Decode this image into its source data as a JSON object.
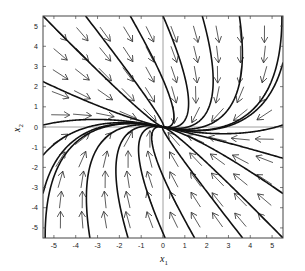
{
  "chart_data": {
    "type": "phase-portrait",
    "title": "",
    "xlabel": "x",
    "xlabel_sub": "1",
    "ylabel": "x",
    "ylabel_sub": "2",
    "xlim": [
      -5.5,
      5.5
    ],
    "ylim": [
      -5.5,
      5.5
    ],
    "xticks": [
      -5,
      -4,
      -3,
      -2,
      -1,
      0,
      1,
      2,
      3,
      4,
      5
    ],
    "yticks": [
      -5,
      -4,
      -3,
      -2,
      -1,
      0,
      1,
      2,
      3,
      4,
      5
    ],
    "grid": false,
    "zero_lines": true,
    "system_matrix": [
      [
        -1,
        1
      ],
      [
        -0.3,
        -2.5
      ]
    ],
    "equilibrium": {
      "x": 0,
      "y": 0,
      "kind": "stable node"
    },
    "arrow_grid": {
      "x": [
        -4.7,
        -3.7,
        -2.65,
        -1.6,
        -0.6,
        0.5,
        1.5,
        2.5,
        3.55,
        4.65
      ],
      "y": [
        4.6,
        3.6,
        2.6,
        1.6,
        0.6,
        -0.6,
        -1.6,
        -2.6,
        -3.6,
        -4.6
      ],
      "length": 0.85
    },
    "trajectory_starts": [
      [
        -5.5,
        5.5
      ],
      [
        -3.55,
        5.5
      ],
      [
        -1.5,
        5.5
      ],
      [
        0.0,
        5.5
      ],
      [
        1.8,
        5.5
      ],
      [
        3.5,
        5.5
      ],
      [
        5.45,
        5.5
      ],
      [
        5.5,
        3.2
      ],
      [
        5.5,
        0.1
      ],
      [
        5.5,
        -1.55
      ],
      [
        5.5,
        -3.3
      ],
      [
        5.5,
        -5.5
      ],
      [
        3.65,
        -5.5
      ],
      [
        1.45,
        -5.5
      ],
      [
        0.1,
        -5.5
      ],
      [
        -1.6,
        -5.5
      ],
      [
        -3.35,
        -5.5
      ],
      [
        -5.4,
        -5.5
      ],
      [
        -5.5,
        -3.3
      ],
      [
        -5.5,
        -1.4
      ],
      [
        -5.5,
        0.1
      ],
      [
        -5.5,
        2.25
      ]
    ],
    "colors": {
      "trajectory": "#111111",
      "arrow": "#333333",
      "frame": "#444444",
      "zero_line": "#888888"
    }
  }
}
